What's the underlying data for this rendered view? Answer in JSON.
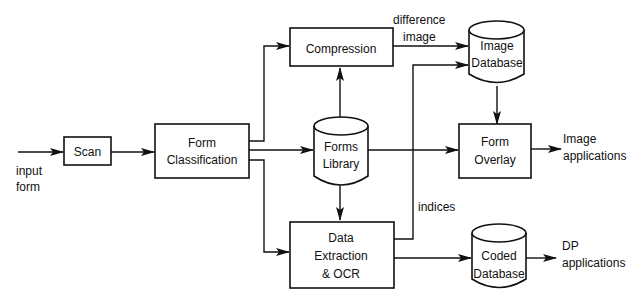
{
  "diagram": {
    "type": "flowchart",
    "colors": {
      "stroke": "#111111",
      "background": "#ffffff"
    },
    "labels": {
      "input_form": [
        "input",
        "form"
      ],
      "difference_image": [
        "difference",
        "image"
      ],
      "indices": "indices",
      "image_applications": [
        "Image",
        "applications"
      ],
      "dp_applications": [
        "DP",
        "applications"
      ]
    },
    "nodes": {
      "scan": {
        "shape": "box",
        "lines": [
          "Scan"
        ]
      },
      "form_classification": {
        "shape": "box",
        "lines": [
          "Form",
          "Classification"
        ]
      },
      "compression": {
        "shape": "box",
        "lines": [
          "Compression"
        ]
      },
      "forms_library": {
        "shape": "cylinder",
        "lines": [
          "Forms",
          "Library"
        ]
      },
      "data_extraction": {
        "shape": "box",
        "lines": [
          "Data",
          "Extraction",
          "& OCR"
        ]
      },
      "image_database": {
        "shape": "cylinder",
        "lines": [
          "Image",
          "Database"
        ]
      },
      "form_overlay": {
        "shape": "box",
        "lines": [
          "Form",
          "Overlay"
        ]
      },
      "coded_database": {
        "shape": "cylinder",
        "lines": [
          "Coded",
          "Database"
        ]
      }
    },
    "edges": [
      {
        "from": "input form",
        "to": "scan"
      },
      {
        "from": "scan",
        "to": "form_classification"
      },
      {
        "from": "form_classification",
        "to": "compression"
      },
      {
        "from": "form_classification",
        "to": "forms_library"
      },
      {
        "from": "form_classification",
        "to": "data_extraction"
      },
      {
        "from": "forms_library",
        "to": "compression"
      },
      {
        "from": "forms_library",
        "to": "data_extraction"
      },
      {
        "from": "forms_library",
        "to": "form_overlay"
      },
      {
        "from": "compression",
        "to": "image_database",
        "label": "difference image"
      },
      {
        "from": "data_extraction",
        "to": "image_database",
        "label": "indices"
      },
      {
        "from": "image_database",
        "to": "form_overlay"
      },
      {
        "from": "form_overlay",
        "to": "Image applications"
      },
      {
        "from": "data_extraction",
        "to": "coded_database"
      },
      {
        "from": "coded_database",
        "to": "DP applications"
      }
    ]
  }
}
